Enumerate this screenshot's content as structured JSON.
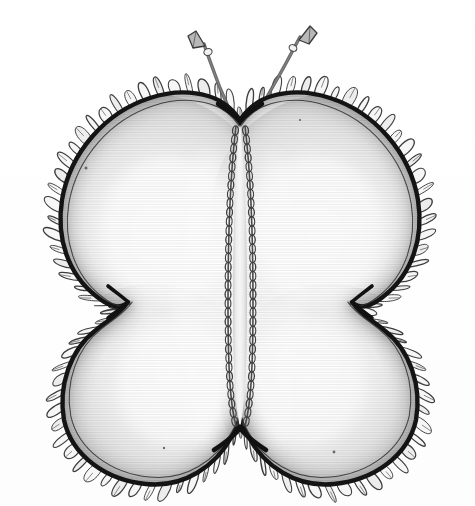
{
  "document": {
    "type": "illustration",
    "medium": "pen-and-ink with pencil shading",
    "subject": "butterfly-shaped ruffled fabric pincushion",
    "title": "Butterfly pincushion line drawing",
    "background_color": "#ffffff",
    "canvas": {
      "width": 475,
      "height": 506
    }
  },
  "palette": {
    "paper": "#ffffff",
    "ink_outline": "#111111",
    "ink_secondary": "#3a3a3a",
    "lace_line": "#4a4a4a",
    "fill_light": "#fafafa",
    "fill_mid": "#e2e2e2",
    "fill_shadow": "#b9b9b9",
    "fill_deep_shadow": "#9a9a9a",
    "body_stitch": "#4b4b4b",
    "antenna": "#555555"
  },
  "figure": {
    "name": "butterfly-pincushion",
    "bounds": {
      "left": 33,
      "top": 18,
      "right": 448,
      "bottom": 492
    },
    "symmetry_axis_x": 240,
    "parts": [
      {
        "id": "left-upper-wing",
        "label": "Left upper wing",
        "center": [
          148,
          215
        ],
        "radius_x": 108,
        "radius_y": 108,
        "shading": "darker along outer left and top rim, fading to near-white toward centre"
      },
      {
        "id": "right-upper-wing",
        "label": "Right upper wing",
        "center": [
          333,
          215
        ],
        "radius_x": 108,
        "radius_y": 108,
        "shading": "darker along outer right and top rim, fading to near-white toward centre"
      },
      {
        "id": "left-lower-wing",
        "label": "Left lower wing",
        "center": [
          150,
          388
        ],
        "radius_x": 98,
        "radius_y": 96,
        "shading": "darker along outer left and bottom rim"
      },
      {
        "id": "right-lower-wing",
        "label": "Right lower wing",
        "center": [
          331,
          388
        ],
        "radius_x": 98,
        "radius_y": 96,
        "shading": "darker along outer right and bottom rim"
      },
      {
        "id": "body",
        "label": "Central body seam",
        "top": [
          240,
          118
        ],
        "bottom": [
          240,
          432
        ],
        "width": 22,
        "decoration": "chain-stitch running along both sides of the narrow body column"
      },
      {
        "id": "left-antenna",
        "label": "Left antenna",
        "base": [
          236,
          126
        ],
        "tip": [
          200,
          34
        ],
        "tip_shape": "flared triangular club"
      },
      {
        "id": "right-antenna",
        "label": "Right antenna",
        "base": [
          249,
          126
        ],
        "tip": [
          300,
          28
        ],
        "tip_shape": "flared triangular club"
      },
      {
        "id": "ruffle-trim",
        "label": "Ruffled lace edging",
        "description": "continuous looped gathered frill following the entire outer silhouette",
        "loop_count": 104,
        "loop_depth": 16
      },
      {
        "id": "inner-seam-line",
        "label": "Inner seam line",
        "description": "thin line echoing the bold outline a few pixels inside it"
      }
    ],
    "notches": [
      {
        "id": "top-centre-notch",
        "point": [
          240,
          122
        ],
        "shape": "V"
      },
      {
        "id": "bottom-centre-notch",
        "point": [
          240,
          430
        ],
        "shape": "V"
      },
      {
        "id": "left-waist-notch",
        "point": [
          128,
          302
        ],
        "shape": "sharp inward point"
      },
      {
        "id": "right-waist-notch",
        "point": [
          352,
          302
        ],
        "shape": "sharp inward point"
      }
    ]
  },
  "alt_text": "A black-and-white pen drawing of a plump butterfly-shaped pincushion. Four rounded padded wings meet at a narrow central body stitched down the middle. A gathered lace ruffle runs all the way around the outer edge, and two thin wire antennae with small flared tips rise from the top."
}
